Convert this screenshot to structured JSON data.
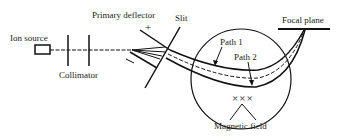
{
  "diagram": {
    "labels": {
      "ion_source": "Ion source",
      "collimator": "Collimator",
      "primary_deflector": "Primary deflector",
      "deflector_sign": "+",
      "deflector_sign_negative": "−",
      "slit": "Slit",
      "focal_plane": "Focal plane",
      "path1": "Path 1",
      "path2": "Path 2",
      "magnetic_field": "Magnetic field",
      "field_symbols": "×××"
    },
    "colors": {
      "line": "#111111",
      "background": "#ffffff"
    }
  }
}
